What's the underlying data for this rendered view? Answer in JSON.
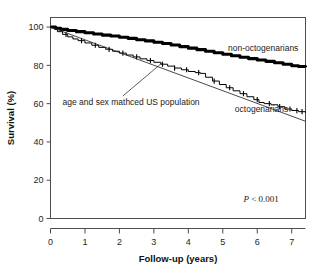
{
  "figure": {
    "background_color": "#ffffff",
    "frame_color": "#4d4d4d",
    "axis_color": "#4d4d4d"
  },
  "chart_data": {
    "type": "line",
    "title": "",
    "subtitle": "",
    "xlabel": "Follow-up (years)",
    "ylabel": "Survival (%)",
    "xlim": [
      0,
      7.4
    ],
    "ylim": [
      0,
      105
    ],
    "xticks": [
      0,
      1,
      2,
      3,
      4,
      5,
      6,
      7
    ],
    "xtick_labels": [
      "0",
      "1",
      "2",
      "3",
      "4",
      "5",
      "6",
      "7"
    ],
    "yticks": [
      0,
      20,
      40,
      60,
      80,
      100
    ],
    "ytick_labels": [
      "0",
      "20",
      "40",
      "60",
      "80",
      "100"
    ],
    "grid": false,
    "legend_position": "inline-annotations",
    "series": [
      {
        "name": "non-octogenarians",
        "style": "thick-step",
        "color": "#000000",
        "line_width": 3.1,
        "x": [
          0,
          0.15,
          0.3,
          0.5,
          0.75,
          1.0,
          1.25,
          1.5,
          1.75,
          2.0,
          2.25,
          2.5,
          2.75,
          3.0,
          3.25,
          3.5,
          3.75,
          4.0,
          4.25,
          4.5,
          4.75,
          5.0,
          5.25,
          5.5,
          5.75,
          6.0,
          6.25,
          6.5,
          6.75,
          7.0,
          7.2,
          7.4
        ],
        "values": [
          100,
          99.4,
          98.8,
          98.2,
          97.6,
          97.0,
          96.4,
          95.8,
          95.3,
          94.7,
          94.1,
          93.4,
          92.8,
          92.1,
          91.4,
          90.6,
          89.8,
          89.0,
          88.2,
          87.4,
          86.6,
          85.8,
          85.0,
          84.2,
          83.5,
          82.8,
          82.1,
          81.4,
          80.6,
          79.8,
          79.4,
          79.0
        ]
      },
      {
        "name": "octogenarians",
        "style": "thin-step-with-censor-ticks",
        "color": "#000000",
        "line_width": 1.0,
        "x": [
          0,
          0.1,
          0.2,
          0.35,
          0.5,
          0.65,
          0.8,
          1.0,
          1.2,
          1.4,
          1.6,
          1.8,
          2.0,
          2.2,
          2.4,
          2.6,
          2.8,
          3.0,
          3.2,
          3.4,
          3.6,
          3.8,
          4.0,
          4.2,
          4.35,
          4.5,
          4.7,
          4.9,
          5.1,
          5.3,
          5.5,
          5.7,
          5.9,
          6.05,
          6.2,
          6.4,
          6.6,
          6.8,
          7.0,
          7.2,
          7.4
        ],
        "values": [
          100,
          99.0,
          97.6,
          96.2,
          94.9,
          93.8,
          92.9,
          91.7,
          90.5,
          89.4,
          88.4,
          87.4,
          86.4,
          85.4,
          84.4,
          83.4,
          82.5,
          81.6,
          80.6,
          79.6,
          78.6,
          77.7,
          76.8,
          76.2,
          75.8,
          73.8,
          71.8,
          70.0,
          68.3,
          66.7,
          65.2,
          63.6,
          62.1,
          60.6,
          60.0,
          59.4,
          58.4,
          57.2,
          56.4,
          55.8,
          55.2
        ],
        "censor_marks_x": [
          0.45,
          0.9,
          1.3,
          1.7,
          2.1,
          2.5,
          2.9,
          3.25,
          3.6,
          3.95,
          4.3,
          4.75,
          5.2,
          5.6,
          6.0,
          6.35,
          6.65,
          6.95,
          7.15,
          7.3
        ]
      },
      {
        "name": "age and sex mathced US population",
        "style": "thin-straight",
        "color": "#1a1a1a",
        "line_width": 0.8,
        "x": [
          0,
          7.4
        ],
        "values": [
          100,
          50.8
        ]
      }
    ],
    "annotations": [
      {
        "id": "non-octogenarians-label",
        "text": "non-octogenarians",
        "x": 5.15,
        "y": 87.5
      },
      {
        "id": "octogenarians-label",
        "text": "octogenarians",
        "x": 5.35,
        "y": 55.5
      },
      {
        "id": "us-population-label",
        "text": "age and sex mathced US population",
        "x": 0.35,
        "y": 59.5,
        "leader_line": {
          "from_x": 2.1,
          "from_y": 64.0,
          "to_x": 3.25,
          "to_y": 81.5
        }
      },
      {
        "id": "p-value",
        "text_italic": "P",
        "text": " < 0.001",
        "x": 5.6,
        "y": 8.5
      }
    ]
  }
}
